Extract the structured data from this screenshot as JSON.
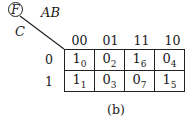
{
  "function_label": "F",
  "row_variable": "C",
  "column_variables": "AB",
  "column_headers": [
    "00",
    "01",
    "11",
    "10"
  ],
  "row_headers": [
    "0",
    "1"
  ],
  "cells": [
    [
      {
        "value": "1",
        "minterm": "0"
      },
      {
        "value": "0",
        "minterm": "2"
      },
      {
        "value": "1",
        "minterm": "6"
      },
      {
        "value": "0",
        "minterm": "4"
      }
    ],
    [
      {
        "value": "1",
        "minterm": "1"
      },
      {
        "value": "0",
        "minterm": "3"
      },
      {
        "value": "0",
        "minterm": "7"
      },
      {
        "value": "1",
        "minterm": "5"
      }
    ]
  ],
  "caption": "(b)"
}
